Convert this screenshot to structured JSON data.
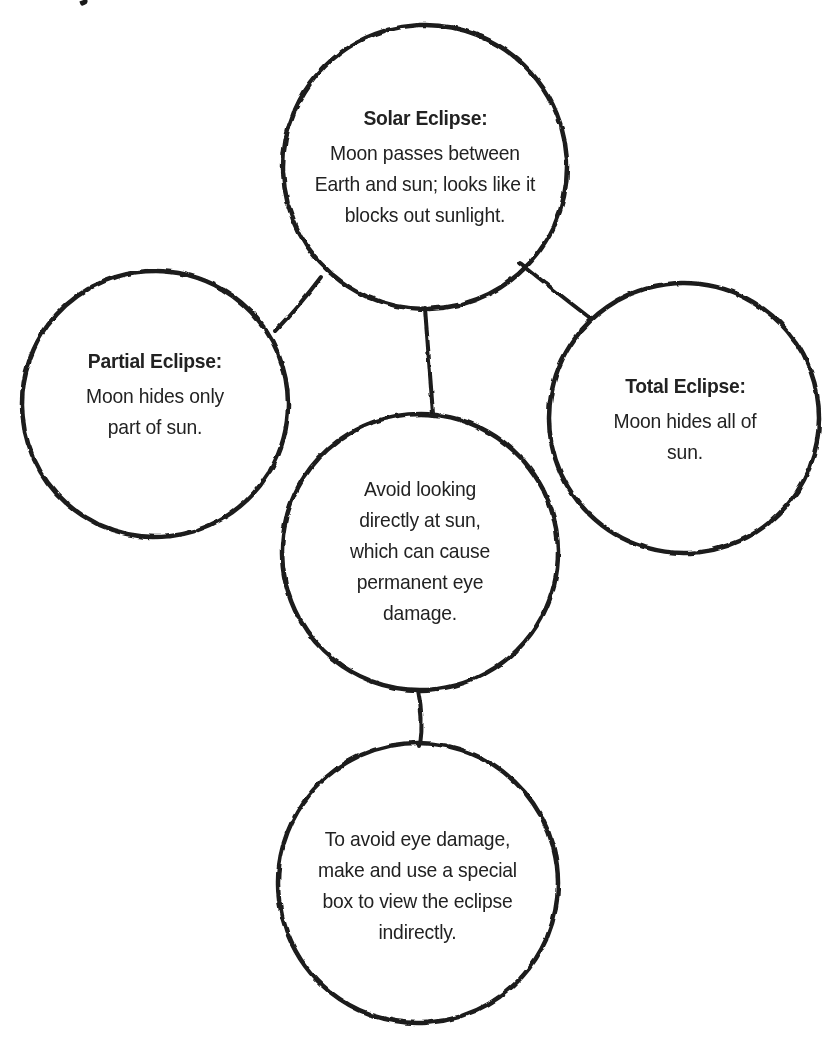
{
  "diagram": {
    "type": "concept-web",
    "colors": {
      "stroke": "#1a1a1a",
      "text": "#222222",
      "background": "#ffffff"
    },
    "nodes": [
      {
        "id": "solar",
        "title": "Solar Eclipse:",
        "body": "Moon passes between Earth and sun; looks like it blocks out sunlight."
      },
      {
        "id": "partial",
        "title": "Partial Eclipse:",
        "body": "Moon hides only part of sun."
      },
      {
        "id": "total",
        "title": "Total Eclipse:",
        "body": "Moon hides all of sun."
      },
      {
        "id": "warning",
        "title": "",
        "body": "Avoid looking directly at sun, which can cause permanent eye damage."
      },
      {
        "id": "safety",
        "title": "",
        "body": "To avoid eye damage, make and use a special box to view the eclipse indirectly."
      }
    ],
    "edges": [
      {
        "from": "solar",
        "to": "partial"
      },
      {
        "from": "solar",
        "to": "total"
      },
      {
        "from": "solar",
        "to": "warning"
      },
      {
        "from": "warning",
        "to": "safety"
      }
    ]
  }
}
